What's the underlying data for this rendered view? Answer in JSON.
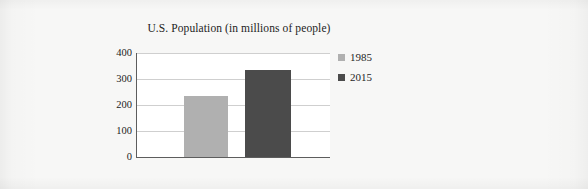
{
  "chart_data": {
    "type": "bar",
    "title": "U.S. Population (in millions of people)",
    "xlabel": "",
    "ylabel": "",
    "categories": [
      ""
    ],
    "series": [
      {
        "name": "1985",
        "values": [
          235
        ],
        "color": "#b0b0b0"
      },
      {
        "name": "2015",
        "values": [
          335
        ],
        "color": "#4b4b4b"
      }
    ],
    "ylim": [
      0,
      400
    ],
    "yticks": [
      0,
      100,
      200,
      300,
      400
    ],
    "ytick_labels": [
      "0",
      "100",
      "200",
      "300",
      "400"
    ],
    "grid": true,
    "legend_position": "right",
    "legend_entries": [
      {
        "label": "1985",
        "color": "#b0b0b0"
      },
      {
        "label": "2015",
        "color": "#4b4b4b"
      }
    ]
  },
  "colors": {
    "page_background": "#f7f7f6",
    "plot_background": "#ffffff",
    "axis": "#5d5d5d",
    "gridline": "#cfcfcf",
    "series_1985": "#b0b0b0",
    "series_2015": "#4b4b4b",
    "text": "#232323"
  }
}
